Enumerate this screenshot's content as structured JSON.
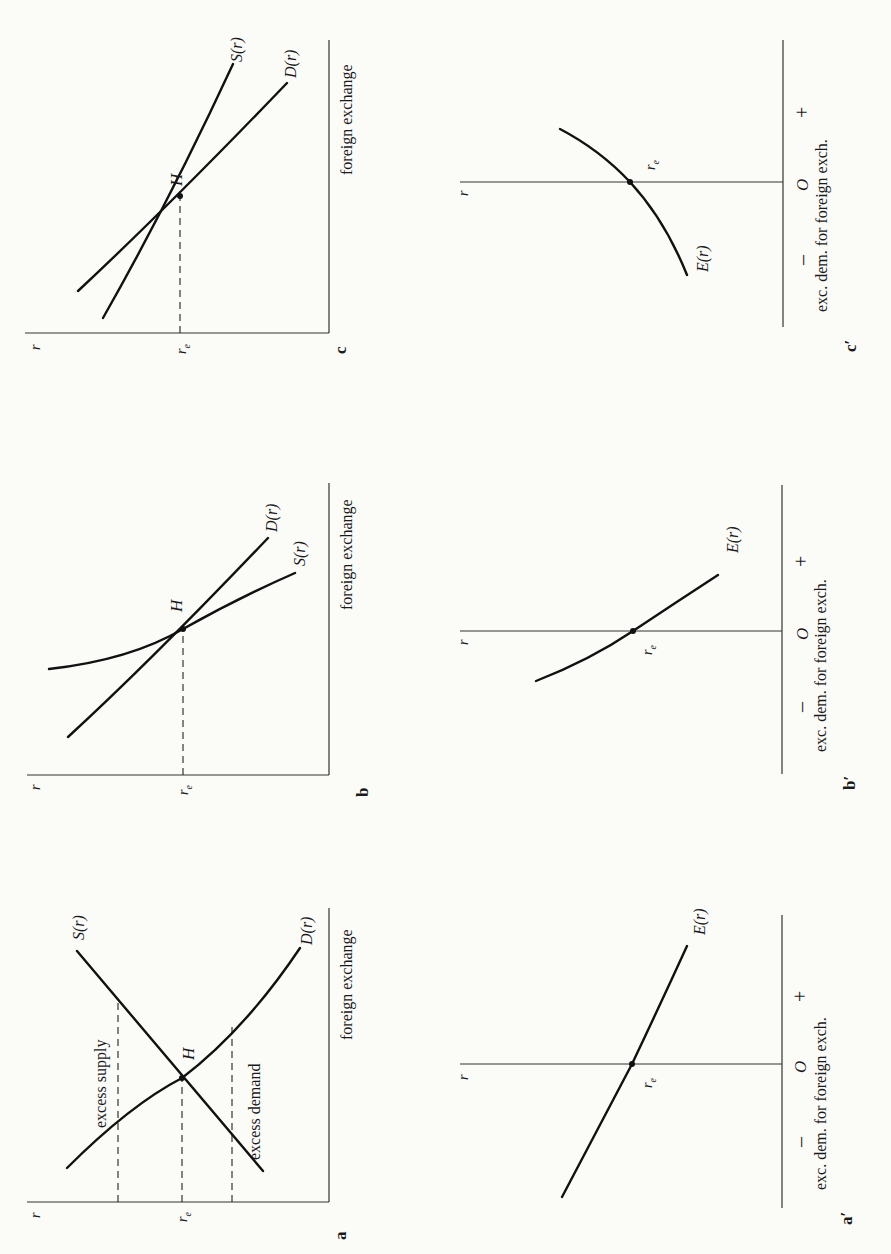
{
  "figure": {
    "orientation": "rotated -90 degrees (page turned sideways)",
    "panels": [
      {
        "id": "a",
        "label": "a",
        "x_axis_label": "foreign exchange",
        "y_axis_label": "r",
        "equilibrium_rate_label": "r",
        "equilibrium_rate_subscript": "e",
        "equilibrium_point_label": "H",
        "curves": [
          {
            "name": "supply",
            "label": "S(r)"
          },
          {
            "name": "demand",
            "label": "D(r)"
          }
        ],
        "annotations": [
          "excess supply",
          "excess demand"
        ]
      },
      {
        "id": "b",
        "label": "b",
        "x_axis_label": "foreign exchange",
        "y_axis_label": "r",
        "equilibrium_rate_label": "r",
        "equilibrium_rate_subscript": "e",
        "equilibrium_point_label": "H",
        "curves": [
          {
            "name": "demand",
            "label": "D(r)"
          },
          {
            "name": "supply",
            "label": "S(r)"
          }
        ]
      },
      {
        "id": "c",
        "label": "c",
        "x_axis_label": "foreign exchange",
        "y_axis_label": "r",
        "equilibrium_rate_label": "r",
        "equilibrium_rate_subscript": "e",
        "equilibrium_point_label": "H",
        "curves": [
          {
            "name": "supply",
            "label": "S(r)"
          },
          {
            "name": "demand",
            "label": "D(r)"
          }
        ]
      },
      {
        "id": "a_prime",
        "label": "a′",
        "x_axis_label": "exc. dem. for foreign exch.",
        "y_axis_label": "r",
        "origin_label": "O",
        "minus_label": "–",
        "plus_label": "+",
        "equilibrium_rate_label": "r",
        "equilibrium_rate_subscript": "e",
        "curves": [
          {
            "name": "excess-demand",
            "label": "E(r)"
          }
        ]
      },
      {
        "id": "b_prime",
        "label": "b′",
        "x_axis_label": "exc. dem. for foreign exch.",
        "y_axis_label": "r",
        "origin_label": "O",
        "minus_label": "–",
        "plus_label": "+",
        "equilibrium_rate_label": "r",
        "equilibrium_rate_subscript": "e",
        "curves": [
          {
            "name": "excess-demand",
            "label": "E(r)"
          }
        ]
      },
      {
        "id": "c_prime",
        "label": "c′",
        "x_axis_label": "exc. dem. for foreign exch.",
        "y_axis_label": "r",
        "origin_label": "O",
        "minus_label": "–",
        "plus_label": "+",
        "equilibrium_rate_label": "r",
        "equilibrium_rate_subscript": "e",
        "curves": [
          {
            "name": "excess-demand",
            "label": "E(r)"
          }
        ]
      }
    ]
  }
}
